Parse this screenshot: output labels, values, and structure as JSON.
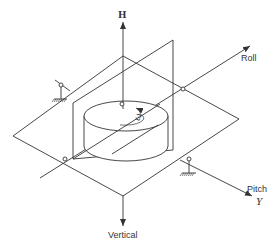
{
  "diagram": {
    "labels": {
      "h_axis": "H",
      "roll_axis": "Roll",
      "pitch_axis": "Pitch",
      "pitch_symbol": "Y",
      "vertical_axis": "Vertical",
      "spin_rate": "ω"
    },
    "components": [
      "angular-momentum-axis",
      "rotor-disc",
      "inner-gimbal-frame",
      "outer-gimbal-plate",
      "ground-mount-left",
      "ground-mount-right",
      "pivot-bearings"
    ],
    "colors": {
      "line": "#333333",
      "background": "#ffffff"
    }
  }
}
